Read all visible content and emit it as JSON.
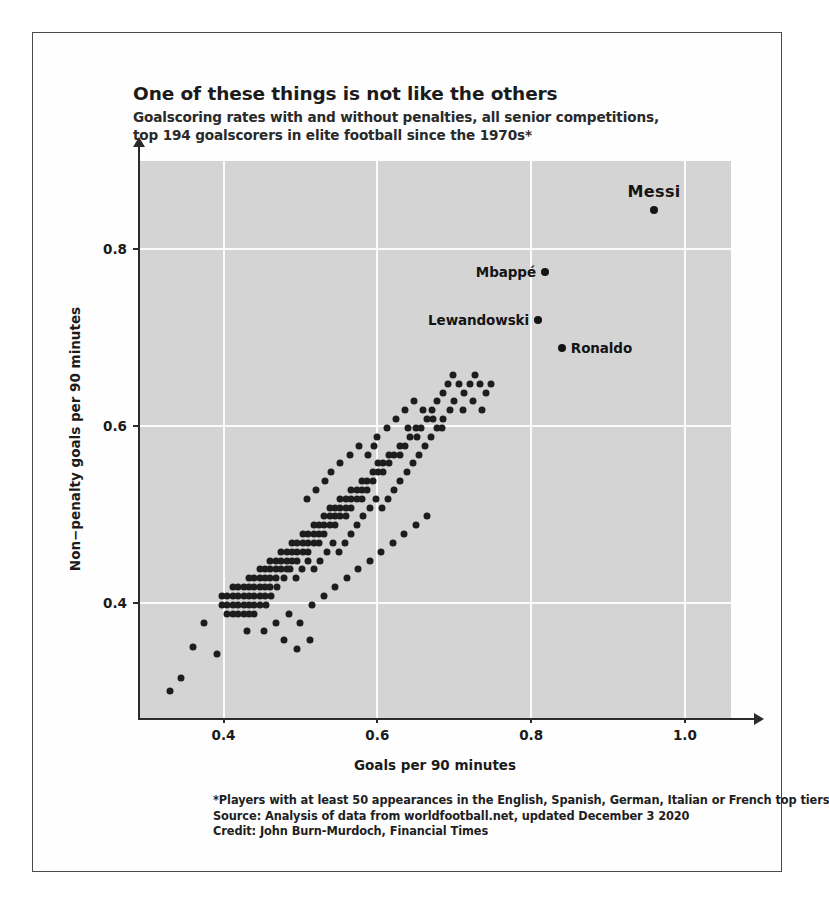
{
  "title": "One of these things is not like the others",
  "subtitle_line1": "Goalscoring rates with and without penalties, all senior competitions,",
  "subtitle_line2": "top 194 goalscorers in elite football since the 1970s*",
  "footer": {
    "note": "*Players with at least 50 appearances in the English, Spanish, German, Italian or French top tiers",
    "source": "Source: Analysis of data from worldfootball.net, updated December 3 2020",
    "credit": "Credit: John Burn-Murdoch, Financial Times"
  },
  "chart_data": {
    "type": "scatter",
    "title": "One of these things is not like the others",
    "subtitle": "Goalscoring rates with and without penalties, all senior competitions, top 194 goalscorers in elite football since the 1970s*",
    "xlabel": "Goals per 90 minutes",
    "ylabel": "Non−penalty goals per 90 minutes",
    "xlim": [
      0.29,
      1.06
    ],
    "ylim": [
      0.27,
      0.9
    ],
    "xticks": [
      0.4,
      0.6,
      0.8,
      1.0
    ],
    "xticklabels": [
      "0.4",
      "0.6",
      "0.8",
      "1.0"
    ],
    "yticks": [
      0.4,
      0.6,
      0.8
    ],
    "yticklabels": [
      "0.4",
      "0.6",
      "0.8"
    ],
    "grid": true,
    "grid_color": "#fbfbfb",
    "plot_background": "#d4d4d4",
    "marker_color": "#1d1d1d",
    "legend": "none",
    "annotations": [
      {
        "name": "Messi",
        "x": 0.96,
        "y": 0.845,
        "label_position": "above",
        "emphasis": "large-bold"
      },
      {
        "name": "Mbappé",
        "x": 0.818,
        "y": 0.775,
        "label_position": "left",
        "emphasis": "bold"
      },
      {
        "name": "Lewandowski",
        "x": 0.809,
        "y": 0.72,
        "label_position": "left",
        "emphasis": "bold"
      },
      {
        "name": "Ronaldo",
        "x": 0.84,
        "y": 0.688,
        "label_position": "right",
        "emphasis": "bold"
      }
    ],
    "points": [
      [
        0.33,
        0.3
      ],
      [
        0.345,
        0.315
      ],
      [
        0.375,
        0.378
      ],
      [
        0.36,
        0.35
      ],
      [
        0.392,
        0.342
      ],
      [
        0.398,
        0.398
      ],
      [
        0.398,
        0.408
      ],
      [
        0.405,
        0.398
      ],
      [
        0.405,
        0.408
      ],
      [
        0.412,
        0.398
      ],
      [
        0.412,
        0.408
      ],
      [
        0.412,
        0.418
      ],
      [
        0.419,
        0.398
      ],
      [
        0.419,
        0.408
      ],
      [
        0.419,
        0.418
      ],
      [
        0.426,
        0.398
      ],
      [
        0.426,
        0.408
      ],
      [
        0.426,
        0.418
      ],
      [
        0.433,
        0.408
      ],
      [
        0.433,
        0.418
      ],
      [
        0.433,
        0.428
      ],
      [
        0.44,
        0.408
      ],
      [
        0.44,
        0.418
      ],
      [
        0.44,
        0.428
      ],
      [
        0.447,
        0.418
      ],
      [
        0.447,
        0.428
      ],
      [
        0.447,
        0.438
      ],
      [
        0.412,
        0.388
      ],
      [
        0.419,
        0.388
      ],
      [
        0.405,
        0.388
      ],
      [
        0.426,
        0.388
      ],
      [
        0.433,
        0.388
      ],
      [
        0.44,
        0.388
      ],
      [
        0.433,
        0.398
      ],
      [
        0.44,
        0.398
      ],
      [
        0.447,
        0.398
      ],
      [
        0.447,
        0.408
      ],
      [
        0.454,
        0.408
      ],
      [
        0.454,
        0.418
      ],
      [
        0.454,
        0.428
      ],
      [
        0.454,
        0.438
      ],
      [
        0.461,
        0.418
      ],
      [
        0.461,
        0.428
      ],
      [
        0.461,
        0.438
      ],
      [
        0.461,
        0.448
      ],
      [
        0.468,
        0.428
      ],
      [
        0.468,
        0.438
      ],
      [
        0.468,
        0.448
      ],
      [
        0.475,
        0.438
      ],
      [
        0.475,
        0.448
      ],
      [
        0.475,
        0.458
      ],
      [
        0.482,
        0.438
      ],
      [
        0.482,
        0.448
      ],
      [
        0.482,
        0.458
      ],
      [
        0.489,
        0.448
      ],
      [
        0.489,
        0.458
      ],
      [
        0.489,
        0.468
      ],
      [
        0.496,
        0.448
      ],
      [
        0.496,
        0.458
      ],
      [
        0.496,
        0.468
      ],
      [
        0.503,
        0.458
      ],
      [
        0.503,
        0.468
      ],
      [
        0.503,
        0.478
      ],
      [
        0.51,
        0.458
      ],
      [
        0.51,
        0.468
      ],
      [
        0.51,
        0.478
      ],
      [
        0.517,
        0.468
      ],
      [
        0.517,
        0.478
      ],
      [
        0.517,
        0.488
      ],
      [
        0.524,
        0.468
      ],
      [
        0.524,
        0.478
      ],
      [
        0.524,
        0.488
      ],
      [
        0.531,
        0.478
      ],
      [
        0.531,
        0.488
      ],
      [
        0.531,
        0.498
      ],
      [
        0.538,
        0.488
      ],
      [
        0.538,
        0.498
      ],
      [
        0.538,
        0.508
      ],
      [
        0.545,
        0.488
      ],
      [
        0.545,
        0.498
      ],
      [
        0.545,
        0.508
      ],
      [
        0.552,
        0.498
      ],
      [
        0.552,
        0.508
      ],
      [
        0.552,
        0.518
      ],
      [
        0.559,
        0.498
      ],
      [
        0.559,
        0.508
      ],
      [
        0.559,
        0.518
      ],
      [
        0.566,
        0.508
      ],
      [
        0.566,
        0.518
      ],
      [
        0.566,
        0.528
      ],
      [
        0.573,
        0.518
      ],
      [
        0.573,
        0.528
      ],
      [
        0.58,
        0.518
      ],
      [
        0.58,
        0.528
      ],
      [
        0.58,
        0.538
      ],
      [
        0.587,
        0.528
      ],
      [
        0.587,
        0.538
      ],
      [
        0.594,
        0.538
      ],
      [
        0.594,
        0.548
      ],
      [
        0.601,
        0.548
      ],
      [
        0.601,
        0.558
      ],
      [
        0.608,
        0.548
      ],
      [
        0.608,
        0.558
      ],
      [
        0.615,
        0.558
      ],
      [
        0.615,
        0.568
      ],
      [
        0.622,
        0.568
      ],
      [
        0.629,
        0.568
      ],
      [
        0.629,
        0.578
      ],
      [
        0.636,
        0.578
      ],
      [
        0.643,
        0.588
      ],
      [
        0.65,
        0.598
      ],
      [
        0.657,
        0.598
      ],
      [
        0.664,
        0.608
      ],
      [
        0.671,
        0.618
      ],
      [
        0.678,
        0.628
      ],
      [
        0.685,
        0.638
      ],
      [
        0.692,
        0.648
      ],
      [
        0.699,
        0.658
      ],
      [
        0.706,
        0.648
      ],
      [
        0.713,
        0.638
      ],
      [
        0.72,
        0.648
      ],
      [
        0.727,
        0.658
      ],
      [
        0.734,
        0.648
      ],
      [
        0.741,
        0.638
      ],
      [
        0.748,
        0.648
      ],
      [
        0.455,
        0.398
      ],
      [
        0.462,
        0.408
      ],
      [
        0.47,
        0.418
      ],
      [
        0.478,
        0.428
      ],
      [
        0.486,
        0.438
      ],
      [
        0.494,
        0.428
      ],
      [
        0.502,
        0.438
      ],
      [
        0.51,
        0.448
      ],
      [
        0.518,
        0.438
      ],
      [
        0.526,
        0.448
      ],
      [
        0.534,
        0.458
      ],
      [
        0.542,
        0.468
      ],
      [
        0.55,
        0.458
      ],
      [
        0.558,
        0.468
      ],
      [
        0.566,
        0.478
      ],
      [
        0.574,
        0.488
      ],
      [
        0.582,
        0.498
      ],
      [
        0.59,
        0.508
      ],
      [
        0.598,
        0.518
      ],
      [
        0.606,
        0.508
      ],
      [
        0.614,
        0.518
      ],
      [
        0.622,
        0.528
      ],
      [
        0.63,
        0.538
      ],
      [
        0.638,
        0.548
      ],
      [
        0.646,
        0.558
      ],
      [
        0.654,
        0.568
      ],
      [
        0.662,
        0.578
      ],
      [
        0.67,
        0.588
      ],
      [
        0.678,
        0.598
      ],
      [
        0.686,
        0.608
      ],
      [
        0.694,
        0.618
      ],
      [
        0.43,
        0.368
      ],
      [
        0.452,
        0.368
      ],
      [
        0.468,
        0.378
      ],
      [
        0.485,
        0.388
      ],
      [
        0.5,
        0.378
      ],
      [
        0.515,
        0.398
      ],
      [
        0.53,
        0.408
      ],
      [
        0.545,
        0.418
      ],
      [
        0.478,
        0.358
      ],
      [
        0.496,
        0.348
      ],
      [
        0.512,
        0.358
      ],
      [
        0.56,
        0.428
      ],
      [
        0.575,
        0.438
      ],
      [
        0.59,
        0.448
      ],
      [
        0.605,
        0.458
      ],
      [
        0.62,
        0.468
      ],
      [
        0.635,
        0.478
      ],
      [
        0.65,
        0.488
      ],
      [
        0.665,
        0.498
      ],
      [
        0.6,
        0.588
      ],
      [
        0.612,
        0.598
      ],
      [
        0.624,
        0.608
      ],
      [
        0.636,
        0.618
      ],
      [
        0.648,
        0.628
      ],
      [
        0.66,
        0.618
      ],
      [
        0.672,
        0.608
      ],
      [
        0.684,
        0.598
      ],
      [
        0.588,
        0.568
      ],
      [
        0.596,
        0.578
      ],
      [
        0.64,
        0.598
      ],
      [
        0.652,
        0.588
      ],
      [
        0.7,
        0.628
      ],
      [
        0.712,
        0.618
      ],
      [
        0.724,
        0.628
      ],
      [
        0.736,
        0.618
      ],
      [
        0.54,
        0.548
      ],
      [
        0.552,
        0.558
      ],
      [
        0.564,
        0.568
      ],
      [
        0.576,
        0.578
      ],
      [
        0.508,
        0.518
      ],
      [
        0.52,
        0.528
      ],
      [
        0.532,
        0.538
      ]
    ]
  }
}
